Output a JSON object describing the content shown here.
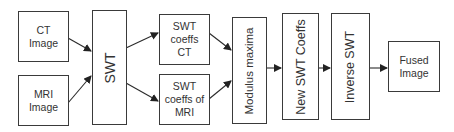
{
  "diagram": {
    "nodes": {
      "ct_image": {
        "label": "CT\nImage"
      },
      "mri_image": {
        "label": "MRI\nImage"
      },
      "swt": {
        "label": "SWT"
      },
      "swt_coeffs_ct": {
        "label": "SWT\ncoeffs\nCT"
      },
      "swt_coeffs_mri": {
        "label": "SWT\ncoeffs of\nMRI"
      },
      "modulus_maxima": {
        "label": "Modulus maxima"
      },
      "new_swt_coeffs": {
        "label": "New SWT Coeffs"
      },
      "inverse_swt": {
        "label": "Inverse SWT"
      },
      "fused_image": {
        "label": "Fused\nImage"
      }
    },
    "edges": [
      {
        "from": "ct_image",
        "to": "swt"
      },
      {
        "from": "mri_image",
        "to": "swt"
      },
      {
        "from": "swt",
        "to": "swt_coeffs_ct"
      },
      {
        "from": "swt",
        "to": "swt_coeffs_mri"
      },
      {
        "from": "swt_coeffs_ct",
        "to": "modulus_maxima"
      },
      {
        "from": "swt_coeffs_mri",
        "to": "modulus_maxima"
      },
      {
        "from": "modulus_maxima",
        "to": "new_swt_coeffs"
      },
      {
        "from": "new_swt_coeffs",
        "to": "inverse_swt"
      },
      {
        "from": "inverse_swt",
        "to": "fused_image"
      }
    ],
    "colors": {
      "stroke": "#3a3a3a",
      "text": "#333333",
      "background": "#ffffff"
    }
  }
}
